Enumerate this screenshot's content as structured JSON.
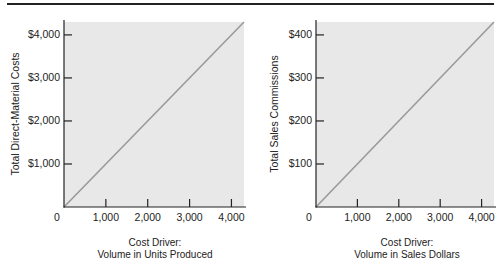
{
  "chart_data": [
    {
      "type": "line",
      "title": "",
      "xlabel": "Cost Driver: Volume in Units Produced",
      "xlabel_lines": [
        "Cost Driver:",
        "Volume in Units Produced"
      ],
      "ylabel": "Total Direct-Material Costs",
      "x_ticks": [
        "0",
        "1,000",
        "2,000",
        "3,000",
        "4,000"
      ],
      "y_ticks": [
        "$1,000",
        "$2,000",
        "$3,000",
        "$4,000"
      ],
      "x": [
        0,
        4300
      ],
      "series": [
        {
          "name": "Total Direct-Material Costs",
          "values": [
            0,
            4300
          ]
        }
      ],
      "xlim": [
        0,
        4300
      ],
      "ylim": [
        0,
        4300
      ],
      "grid": false,
      "background": "#e8e8e8",
      "line_color": "#9a9a9a"
    },
    {
      "type": "line",
      "title": "",
      "xlabel": "Cost Driver: Volume in Sales Dollars",
      "xlabel_lines": [
        "Cost Driver:",
        "Volume in Sales Dollars"
      ],
      "ylabel": "Total Sales Commissions",
      "x_ticks": [
        "0",
        "1,000",
        "2,000",
        "3,000",
        "4,000"
      ],
      "y_ticks": [
        "$100",
        "$200",
        "$300",
        "$400"
      ],
      "x": [
        0,
        4300
      ],
      "series": [
        {
          "name": "Total Sales Commissions",
          "values": [
            0,
            430
          ]
        }
      ],
      "xlim": [
        0,
        4300
      ],
      "ylim": [
        0,
        430
      ],
      "grid": false,
      "background": "#e8e8e8",
      "line_color": "#9a9a9a"
    }
  ]
}
